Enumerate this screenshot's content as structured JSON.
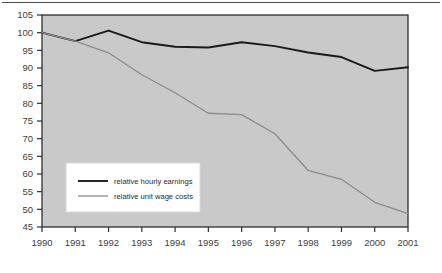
{
  "figure": {
    "name": "relative-hourly-earnings-and-unit-wage-costs-chart",
    "plot_bg_color": "#c9c9c9",
    "frame_color": "#2f2f2f",
    "top_rule_color": "#4a4a4a"
  },
  "legend": {
    "position": "inside-bottom-left",
    "background": "#ffffff",
    "border_color": "#d8d8d8",
    "entries": [
      {
        "label": "relative hourly earnings",
        "color": "#1a1a1a",
        "width": 1.9
      },
      {
        "label": "relative unit wage costs",
        "color": "#8c8c8c",
        "width": 1.3
      }
    ]
  },
  "chart_data": {
    "type": "line",
    "title": "",
    "subtitle": "",
    "xlabel": "",
    "ylabel": "",
    "xlim": [
      1990,
      2001
    ],
    "ylim": [
      45,
      105
    ],
    "grid": false,
    "legend_position": "inside-bottom-left",
    "x": [
      1990,
      1991,
      1992,
      1993,
      1994,
      1995,
      1996,
      1997,
      1998,
      1999,
      2000,
      2001
    ],
    "xtick_labels": [
      "1990",
      "1991",
      "1992",
      "1993",
      "1994",
      "1995",
      "1996",
      "1997",
      "1998",
      "1999",
      "2000",
      "2001"
    ],
    "ytick_labels": [
      "45",
      "50",
      "55",
      "60",
      "65",
      "70",
      "75",
      "80",
      "85",
      "90",
      "95",
      "100",
      "105"
    ],
    "ytick_values": [
      45,
      50,
      55,
      60,
      65,
      70,
      75,
      80,
      85,
      90,
      95,
      100,
      105
    ],
    "series": [
      {
        "name": "relative hourly earnings",
        "color": "#1a1a1a",
        "values": [
          100.0,
          97.6,
          100.6,
          97.3,
          96.0,
          95.8,
          97.3,
          96.2,
          94.4,
          93.1,
          89.2,
          90.2
        ]
      },
      {
        "name": "relative unit wage costs",
        "color": "#8c8c8c",
        "values": [
          100.0,
          97.6,
          94.3,
          88.1,
          83.0,
          77.2,
          76.8,
          71.4,
          61.0,
          58.5,
          52.0,
          48.8
        ]
      }
    ]
  }
}
